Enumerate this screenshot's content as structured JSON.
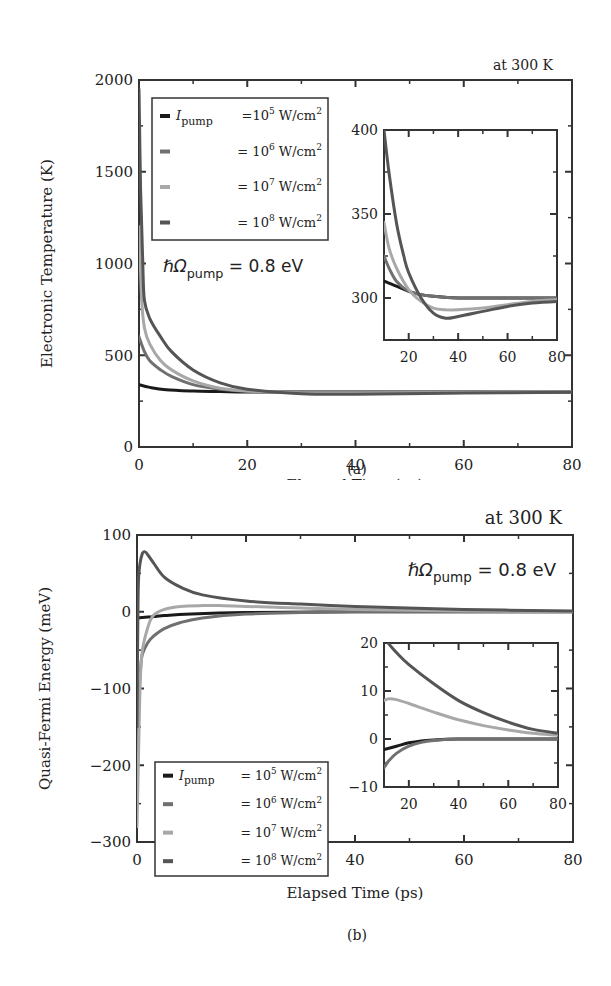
{
  "chart_data": [
    {
      "id": "a",
      "type": "line",
      "panel_label": "(a)",
      "title": "",
      "corner_note": "at 300 K",
      "annotation": {
        "prefix": "ℏΩ",
        "sub": "pump",
        "suffix": " = 0.8 eV"
      },
      "xlabel": "Elapsed Time (ps)",
      "ylabel": "Electronic Temperature (K)",
      "xlim": [
        0,
        80
      ],
      "ylim": [
        0,
        2000
      ],
      "xticks": [
        0,
        20,
        40,
        60,
        80
      ],
      "yticks": [
        0,
        500,
        1000,
        1500,
        2000
      ],
      "grid": false,
      "legend_position": "upper-left",
      "legend": [
        {
          "prefix": "I",
          "sub": "pump",
          "text": "=10",
          "exp": "5",
          "unit": " W/cm",
          "unit_exp": "2"
        },
        {
          "prefix": "",
          "sub": "",
          "text": "= 10",
          "exp": "6",
          "unit": " W/cm",
          "unit_exp": "2"
        },
        {
          "prefix": "",
          "sub": "",
          "text": "= 10",
          "exp": "7",
          "unit": " W/cm",
          "unit_exp": "2"
        },
        {
          "prefix": "",
          "sub": "",
          "text": "= 10",
          "exp": "8",
          "unit": " W/cm",
          "unit_exp": "2"
        }
      ],
      "series": [
        {
          "name": "I_pump = 1e5 W/cm^2",
          "color": "#1a1a1a",
          "x": [
            0,
            2,
            5,
            10,
            15,
            20,
            30,
            40,
            60,
            80
          ],
          "values": [
            340,
            325,
            312,
            305,
            302,
            300,
            300,
            300,
            300,
            300
          ]
        },
        {
          "name": "I_pump = 1e6 W/cm^2",
          "color": "#707070",
          "x": [
            0,
            1,
            2,
            4,
            6,
            10,
            15,
            20,
            30,
            40,
            60,
            80
          ],
          "values": [
            600,
            520,
            470,
            420,
            385,
            340,
            315,
            304,
            300,
            300,
            300,
            300
          ]
        },
        {
          "name": "I_pump = 1e7 W/cm^2",
          "color": "#a8a8a8",
          "x": [
            0,
            0.5,
            1,
            2,
            4,
            6,
            10,
            15,
            20,
            30,
            40,
            60,
            80
          ],
          "values": [
            1200,
            800,
            650,
            560,
            470,
            420,
            360,
            320,
            305,
            295,
            294,
            297,
            299
          ]
        },
        {
          "name": "I_pump = 1e8 W/cm^2",
          "color": "#555555",
          "x": [
            0,
            0.3,
            0.7,
            1,
            2,
            4,
            6,
            10,
            15,
            20,
            30,
            40,
            60,
            80
          ],
          "values": [
            1950,
            1400,
            1000,
            800,
            700,
            600,
            520,
            420,
            350,
            315,
            290,
            288,
            294,
            298
          ]
        }
      ],
      "inset": {
        "xlim": [
          10,
          80
        ],
        "ylim": [
          275,
          400
        ],
        "xticks": [
          20,
          40,
          60,
          80
        ],
        "yticks": [
          300,
          350,
          400
        ],
        "series": [
          {
            "name": "I_pump = 1e5 W/cm^2",
            "color": "#1a1a1a",
            "x": [
              10,
              15,
              20,
              25,
              30,
              40,
              60,
              80
            ],
            "values": [
              310,
              307,
              304,
              302,
              301,
              300,
              300,
              300
            ]
          },
          {
            "name": "I_pump = 1e6 W/cm^2",
            "color": "#707070",
            "x": [
              10,
              12,
              15,
              20,
              25,
              30,
              40,
              60,
              80
            ],
            "values": [
              325,
              318,
              310,
              304,
              302,
              301,
              300,
              300,
              300
            ]
          },
          {
            "name": "I_pump = 1e7 W/cm^2",
            "color": "#a8a8a8",
            "x": [
              10,
              12,
              15,
              20,
              25,
              30,
              35,
              40,
              50,
              60,
              70,
              80
            ],
            "values": [
              345,
              330,
              318,
              305,
              298,
              294,
              293,
              293,
              294,
              296,
              298,
              299
            ]
          },
          {
            "name": "I_pump = 1e8 W/cm^2",
            "color": "#555555",
            "x": [
              10,
              12,
              15,
              18,
              20,
              25,
              30,
              35,
              40,
              50,
              60,
              70,
              80
            ],
            "values": [
              400,
              375,
              345,
              325,
              315,
              300,
              291,
              288,
              289,
              292,
              295,
              297,
              298
            ]
          }
        ]
      }
    },
    {
      "id": "b",
      "type": "line",
      "panel_label": "(b)",
      "title": "",
      "corner_note": "at 300 K",
      "annotation": {
        "prefix": "ℏΩ",
        "sub": "pump",
        "suffix": " = 0.8 eV"
      },
      "xlabel": "Elapsed Time (ps)",
      "ylabel": "Quasi-Fermi Energy (meV)",
      "xlim": [
        0,
        80
      ],
      "ylim": [
        -300,
        100
      ],
      "xticks": [
        0,
        20,
        40,
        60,
        80
      ],
      "yticks": [
        -300,
        -200,
        -100,
        0,
        100
      ],
      "grid": false,
      "legend_position": "lower-left",
      "legend": [
        {
          "prefix": "I",
          "sub": "pump",
          "text": " = 10",
          "exp": "5",
          "unit": " W/cm",
          "unit_exp": "2"
        },
        {
          "prefix": "",
          "sub": "",
          "text": "= 10",
          "exp": "6",
          "unit": " W/cm",
          "unit_exp": "2"
        },
        {
          "prefix": "",
          "sub": "",
          "text": "= 10",
          "exp": "7",
          "unit": " W/cm",
          "unit_exp": "2"
        },
        {
          "prefix": "",
          "sub": "",
          "text": "= 10",
          "exp": "8",
          "unit": " W/cm",
          "unit_exp": "2"
        }
      ],
      "series": [
        {
          "name": "I_pump = 1e5 W/cm^2",
          "color": "#1a1a1a",
          "x": [
            0,
            2,
            5,
            10,
            20,
            40,
            60,
            80
          ],
          "values": [
            -8,
            -7,
            -5,
            -3,
            -1,
            0,
            0,
            0
          ]
        },
        {
          "name": "I_pump = 1e6 W/cm^2",
          "color": "#707070",
          "x": [
            0,
            0.3,
            0.7,
            1,
            2,
            3,
            5,
            8,
            12,
            20,
            30,
            40,
            60,
            80
          ],
          "values": [
            -250,
            -120,
            -70,
            -55,
            -40,
            -32,
            -22,
            -14,
            -8,
            -3,
            -1,
            0,
            0,
            0
          ]
        },
        {
          "name": "I_pump = 1e7 W/cm^2",
          "color": "#a8a8a8",
          "x": [
            0,
            0.3,
            0.6,
            1,
            2,
            3,
            5,
            8,
            12,
            15,
            20,
            30,
            40,
            60,
            80
          ],
          "values": [
            -280,
            -180,
            -90,
            -50,
            -20,
            -5,
            3,
            7,
            8,
            8,
            7,
            5,
            3,
            1,
            0
          ]
        },
        {
          "name": "I_pump = 1e8 W/cm^2",
          "color": "#555555",
          "x": [
            0,
            0.2,
            0.5,
            1,
            1.5,
            2,
            3,
            5,
            8,
            12,
            20,
            30,
            40,
            60,
            80
          ],
          "values": [
            -150,
            20,
            60,
            76,
            78,
            74,
            64,
            45,
            32,
            22,
            14,
            10,
            7,
            3,
            1
          ]
        }
      ],
      "inset": {
        "xlim": [
          10,
          80
        ],
        "ylim": [
          -10,
          20
        ],
        "xticks": [
          20,
          40,
          60,
          80
        ],
        "yticks": [
          -10,
          0,
          10,
          20
        ],
        "series": [
          {
            "name": "I_pump = 1e5 W/cm^2",
            "color": "#1a1a1a",
            "x": [
              10,
              15,
              20,
              25,
              30,
              40,
              60,
              80
            ],
            "values": [
              -2.2,
              -1.5,
              -0.8,
              -0.4,
              -0.2,
              0,
              0,
              0
            ]
          },
          {
            "name": "I_pump = 1e6 W/cm^2",
            "color": "#707070",
            "x": [
              10,
              12,
              15,
              20,
              25,
              30,
              40,
              60,
              80
            ],
            "values": [
              -6,
              -4.5,
              -3,
              -1.5,
              -0.7,
              -0.3,
              0,
              0,
              0
            ]
          },
          {
            "name": "I_pump = 1e7 W/cm^2",
            "color": "#a8a8a8",
            "x": [
              10,
              12,
              15,
              20,
              30,
              40,
              50,
              60,
              70,
              80
            ],
            "values": [
              8,
              8.4,
              8.2,
              7.4,
              5.6,
              4,
              2.8,
              1.9,
              1.2,
              0.8
            ]
          },
          {
            "name": "I_pump = 1e8 W/cm^2",
            "color": "#555555",
            "x": [
              10,
              15,
              20,
              30,
              40,
              50,
              60,
              70,
              80
            ],
            "values": [
              21,
              18,
              15.5,
              11.5,
              8,
              5.5,
              3.5,
              2,
              1.2
            ]
          }
        ]
      }
    }
  ]
}
